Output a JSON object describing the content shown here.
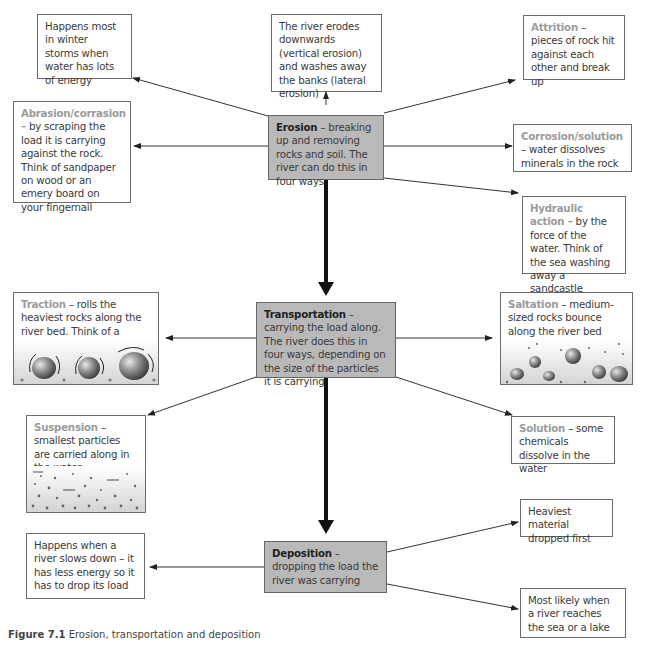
{
  "diagram": {
    "title": "Erosion, transportation and deposition",
    "erosion": {
      "term": "Erosion",
      "text": " – breaking up and removing rocks and soil. The river can do this in four ways",
      "notes": {
        "storms": "Happens most in winter storms when water has lots of energy",
        "direction": "The river erodes downwards (vertical erosion) and washes away the banks (lateral erosion)"
      },
      "processes": [
        {
          "term": "Attrition",
          "text": " – pieces of rock hit against each other and break up"
        },
        {
          "term": "Abrasion/corrasion –",
          "text": " by scraping the load it is carrying against the rock. Think of sandpaper on wood or an emery board on your fingernail"
        },
        {
          "term": "Corrosion/solution",
          "text": " – water dissolves minerals in the rock"
        },
        {
          "term": "Hydraulic action –",
          "text": " by the force of the water. Think of the sea washing away a sandcastle"
        }
      ]
    },
    "transportation": {
      "term": "Transportation",
      "text": " – carrying the load along. The river does this in four ways, depending on the size of the particles it is carrying",
      "processes": [
        {
          "term": "Traction",
          "text": " – rolls the heaviest rocks along the river bed. Think of a tractor moving"
        },
        {
          "term": "Saltation",
          "text": " – medium-sized rocks bounce along the river bed"
        },
        {
          "term": "Suspension",
          "text": " – smallest particles are carried along in the water"
        },
        {
          "term": "Solution",
          "text": " – some chemicals dissolve in the water"
        }
      ]
    },
    "deposition": {
      "term": "Deposition",
      "text": " – dropping the load the river was carrying",
      "notes": {
        "when": "Happens when a river slows down – it has less energy so it has to drop its load",
        "heaviest": "Heaviest material dropped first",
        "likely": "Most likely when a river reaches the sea or a lake"
      }
    },
    "caption": {
      "label": "Figure 7.1",
      "text": " Erosion, transportation and deposition"
    },
    "colors": {
      "main_box": "#b9b9b9",
      "term_gray": "#9a9a9a",
      "border": "#6b6b6b"
    }
  }
}
